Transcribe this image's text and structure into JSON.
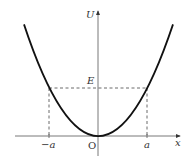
{
  "diagram": {
    "axes": {
      "x_label": "x",
      "y_label": "U",
      "origin_label": "O"
    },
    "ticks": {
      "neg_a": "−a",
      "pos_a": "a"
    },
    "energy_label": "E",
    "curve": "U = k x^2 (parabola, vertex at origin)",
    "dashed_lines": "horizontal at U=E from x=-a to x=a; vertical drops at x=-a and x=a"
  }
}
